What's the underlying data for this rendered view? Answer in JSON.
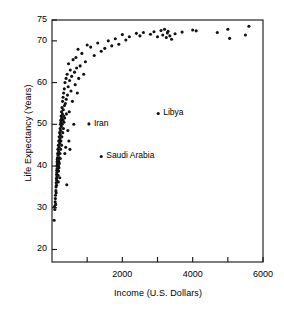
{
  "chart_data": {
    "type": "scatter",
    "title": "",
    "xlabel": "Income (U.S. Dollars)",
    "ylabel": "Life Expectancy (Years)",
    "xlim": [
      0,
      6000
    ],
    "ylim": [
      17,
      75
    ],
    "grid": false,
    "legend": null,
    "xticks": [
      2000,
      4000,
      6000
    ],
    "xticks_labels": [
      "2000",
      "4000",
      "6000"
    ],
    "xminor_ticks": [
      1000,
      3000,
      5000
    ],
    "yticks": [
      20,
      30,
      40,
      50,
      60,
      70,
      75
    ],
    "ytick_labels": [
      "20",
      "30",
      "40",
      "50",
      "60",
      "70",
      "75"
    ],
    "marker": "filled-circle",
    "marker_color": "#111111",
    "marker_size_px": 2.4,
    "annotations": [
      {
        "label": "Iran",
        "x": 1050,
        "y": 50.1
      },
      {
        "label": "Libya",
        "x": 3020,
        "y": 52.6
      },
      {
        "label": "Saudi Arabia",
        "x": 1400,
        "y": 42.3
      }
    ],
    "points": [
      [
        60,
        27.0
      ],
      [
        70,
        30.3
      ],
      [
        80,
        29.6
      ],
      [
        90,
        31.4
      ],
      [
        95,
        32.2
      ],
      [
        100,
        33.0
      ],
      [
        105,
        30.8
      ],
      [
        110,
        34.1
      ],
      [
        115,
        35.0
      ],
      [
        118,
        33.6
      ],
      [
        120,
        36.0
      ],
      [
        125,
        37.0
      ],
      [
        128,
        35.4
      ],
      [
        130,
        38.0
      ],
      [
        133,
        36.6
      ],
      [
        135,
        39.0
      ],
      [
        138,
        37.4
      ],
      [
        140,
        40.0
      ],
      [
        142,
        38.5
      ],
      [
        145,
        41.0
      ],
      [
        148,
        39.4
      ],
      [
        150,
        40.5
      ],
      [
        152,
        41.6
      ],
      [
        155,
        42.0
      ],
      [
        158,
        40.2
      ],
      [
        160,
        43.0
      ],
      [
        162,
        41.2
      ],
      [
        165,
        39.0
      ],
      [
        168,
        44.0
      ],
      [
        170,
        40.8
      ],
      [
        172,
        37.8
      ],
      [
        175,
        42.6
      ],
      [
        178,
        36.2
      ],
      [
        180,
        41.4
      ],
      [
        182,
        45.0
      ],
      [
        185,
        40.0
      ],
      [
        188,
        38.8
      ],
      [
        190,
        43.5
      ],
      [
        192,
        46.0
      ],
      [
        195,
        41.0
      ],
      [
        198,
        39.6
      ],
      [
        200,
        44.5
      ],
      [
        205,
        47.0
      ],
      [
        208,
        40.6
      ],
      [
        210,
        42.0
      ],
      [
        215,
        48.0
      ],
      [
        218,
        45.5
      ],
      [
        220,
        37.2
      ],
      [
        225,
        46.5
      ],
      [
        228,
        43.0
      ],
      [
        230,
        49.0
      ],
      [
        235,
        41.8
      ],
      [
        238,
        47.5
      ],
      [
        240,
        50.0
      ],
      [
        245,
        44.0
      ],
      [
        248,
        48.5
      ],
      [
        250,
        51.0
      ],
      [
        255,
        46.0
      ],
      [
        258,
        50.5
      ],
      [
        260,
        52.0
      ],
      [
        265,
        49.5
      ],
      [
        270,
        53.0
      ],
      [
        272,
        45.0
      ],
      [
        275,
        51.5
      ],
      [
        280,
        47.0
      ],
      [
        285,
        54.0
      ],
      [
        290,
        50.0
      ],
      [
        295,
        52.5
      ],
      [
        300,
        55.5
      ],
      [
        305,
        48.0
      ],
      [
        310,
        51.0
      ],
      [
        315,
        56.5
      ],
      [
        320,
        53.5
      ],
      [
        325,
        49.0
      ],
      [
        330,
        57.5
      ],
      [
        335,
        52.0
      ],
      [
        340,
        50.5
      ],
      [
        350,
        58.5
      ],
      [
        355,
        54.5
      ],
      [
        360,
        51.5
      ],
      [
        365,
        43.0
      ],
      [
        370,
        60.0
      ],
      [
        380,
        55.0
      ],
      [
        390,
        44.5
      ],
      [
        400,
        61.0
      ],
      [
        405,
        56.0
      ],
      [
        410,
        52.5
      ],
      [
        420,
        35.5
      ],
      [
        430,
        62.0
      ],
      [
        440,
        57.0
      ],
      [
        450,
        48.5
      ],
      [
        460,
        59.0
      ],
      [
        470,
        64.5
      ],
      [
        480,
        46.0
      ],
      [
        490,
        53.0
      ],
      [
        500,
        60.5
      ],
      [
        510,
        44.0
      ],
      [
        520,
        63.0
      ],
      [
        540,
        58.0
      ],
      [
        560,
        61.5
      ],
      [
        580,
        55.5
      ],
      [
        600,
        65.5
      ],
      [
        620,
        50.0
      ],
      [
        640,
        62.5
      ],
      [
        660,
        59.5
      ],
      [
        680,
        66.0
      ],
      [
        700,
        63.5
      ],
      [
        720,
        57.5
      ],
      [
        740,
        68.0
      ],
      [
        760,
        61.0
      ],
      [
        800,
        64.0
      ],
      [
        850,
        67.0
      ],
      [
        900,
        62.0
      ],
      [
        950,
        65.0
      ],
      [
        1000,
        69.0
      ],
      [
        1100,
        68.5
      ],
      [
        1200,
        66.5
      ],
      [
        1300,
        69.5
      ],
      [
        1400,
        67.5
      ],
      [
        1500,
        68.2
      ],
      [
        1600,
        70.0
      ],
      [
        1700,
        68.8
      ],
      [
        1800,
        70.5
      ],
      [
        1900,
        69.2
      ],
      [
        2000,
        71.5
      ],
      [
        2100,
        70.2
      ],
      [
        2200,
        71.0
      ],
      [
        2400,
        71.8
      ],
      [
        2500,
        71.2
      ],
      [
        2600,
        72.0
      ],
      [
        2800,
        71.6
      ],
      [
        2900,
        72.2
      ],
      [
        3000,
        71.0
      ],
      [
        3100,
        72.5
      ],
      [
        3150,
        71.4
      ],
      [
        3200,
        72.8
      ],
      [
        3250,
        70.8
      ],
      [
        3280,
        71.9
      ],
      [
        3300,
        72.3
      ],
      [
        3350,
        71.2
      ],
      [
        3400,
        70.4
      ],
      [
        3500,
        71.7
      ],
      [
        3700,
        72.1
      ],
      [
        4000,
        72.6
      ],
      [
        4100,
        72.4
      ],
      [
        4700,
        72.0
      ],
      [
        5000,
        72.8
      ],
      [
        5050,
        70.6
      ],
      [
        5500,
        71.4
      ],
      [
        5600,
        73.5
      ]
    ]
  },
  "axes": {
    "y_title": "Life Expectancy (Years)",
    "x_title": "Income (U.S. Dollars)"
  }
}
